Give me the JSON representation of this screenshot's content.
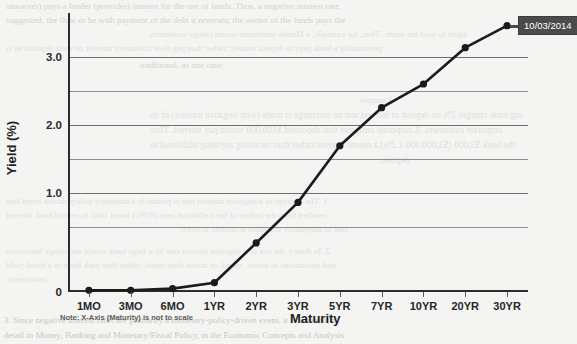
{
  "chart_data": {
    "type": "line",
    "title": "",
    "subtitle": "",
    "xlabel": "Maturity",
    "ylabel": "Yield (%)",
    "categories": [
      "1MO",
      "3MO",
      "6MO",
      "1YR",
      "2YR",
      "3YR",
      "5YR",
      "7YR",
      "10YR",
      "20YR",
      "30YR"
    ],
    "values": [
      0.02,
      0.02,
      0.04,
      0.11,
      0.58,
      1.06,
      1.73,
      2.18,
      2.46,
      2.89,
      3.15
    ],
    "series": [
      {
        "name": "10/03/2014",
        "values": [
          0.02,
          0.02,
          0.04,
          0.11,
          0.58,
          1.06,
          1.73,
          2.18,
          2.46,
          2.89,
          3.15
        ]
      }
    ],
    "ylim": [
      0,
      3.3
    ],
    "ytick_labels": [
      "0",
      "1.0",
      "2.0",
      "3.0"
    ],
    "ytick_values": [
      0,
      1.0,
      2.0,
      3.0
    ],
    "minor_gridline_values": [
      0.5,
      1.5,
      2.5
    ],
    "grid": true,
    "legend_position": "none",
    "annotations": [
      {
        "text": "10/03/2014",
        "attached_to": "30YR",
        "style": "dark-callout-badge"
      },
      {
        "text": "Note: X-Axis (Maturity) is not to scale",
        "position": "below-axis-left"
      }
    ],
    "marker": "filled-circle",
    "line_color": "#1b1b1b",
    "marker_color": "#1b1b1b",
    "badge_bg_color": "#4b4b4b",
    "badge_text_color": "#ffffff",
    "axis_color": "#2c2c2c",
    "gridline_color": "#8d8d8d",
    "background_color": "#f4f4f2"
  },
  "axes": {
    "y_title": "Yield (%)",
    "x_title": "Maturity",
    "y_ticks": [
      {
        "label": "3.0",
        "value": 3.0
      },
      {
        "label": "2.0",
        "value": 2.0
      },
      {
        "label": "1.0",
        "value": 1.0
      },
      {
        "label": "0",
        "value": 0
      }
    ],
    "x_ticks": [
      {
        "label": "1MO"
      },
      {
        "label": "3MO"
      },
      {
        "label": "6MO"
      },
      {
        "label": "1YR"
      },
      {
        "label": "2YR"
      },
      {
        "label": "3YR"
      },
      {
        "label": "5YR"
      },
      {
        "label": "7YR"
      },
      {
        "label": "10YR"
      },
      {
        "label": "20YR"
      },
      {
        "label": "30YR"
      }
    ]
  },
  "callout": {
    "label": "10/03/2014"
  },
  "footnote": {
    "text": "Note: X-Axis (Maturity) is not to scale"
  },
  "background_text": {
    "lines": [
      "unsoever) pays a lender (provider) interest for the use of funds. Thus, a negative interest rate",
      "suggested; the flow or be with payment of the debt it reverses; the owner of the funds pays the",
      "agent to hold the funds. Thus, for example, a Danish institution would charge customers",
      "presumably a bank pays to deposit money; rather than pay their customers interest on their deposits as is",
      "traditional, as one case.",
      "Example",
      "ing bank charges 2% on deposit of interest and no surcharge is made (with negative interest) of its",
      "corporate customers. A corporate customer that deposited $100,000 would pay interest. Thus",
      "the bank $3,000 ($3,000,000 x 2%) a month interest rather than receiving anything additional to",
      "deposit.",
      "1.  The concept of a negative interest rate is primarily a monetary-policy-driven event that",
      "resulted from the failure of the traditional zero (0.0%) lower limit to central bank interest",
      "rate to adequately stimulate economic activity.",
      "2.  In theory, the use of a negative interest rate by a large bank would encourage borrowers",
      "and institutions to invest, spend, or invest their funds, rather than park them in a fixed-yield",
      "instrument.",
      "3.  Since negative interest rates are primarily a monetary-policy-driven event, it is covered in",
      "detail in Money, Banking and Monetary/Fiscal Policy, in the Economic Concepts and Analysis"
    ]
  }
}
